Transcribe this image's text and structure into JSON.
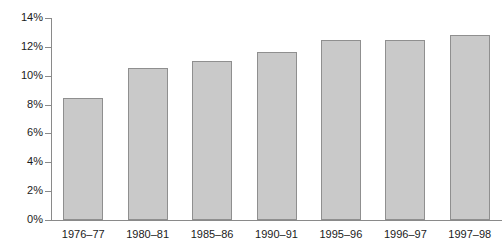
{
  "chart_data": {
    "type": "bar",
    "title": "",
    "subtitle": "",
    "xlabel": "",
    "ylabel": "",
    "categories": [
      "1976–77",
      "1980–81",
      "1985–86",
      "1990–91",
      "1995–96",
      "1996–97",
      "1997–98"
    ],
    "values": [
      8.45,
      10.55,
      11.05,
      11.65,
      12.5,
      12.45,
      12.85
    ],
    "value_unit": "%",
    "ylim": [
      0,
      14
    ],
    "ytick_values": [
      0,
      2,
      4,
      6,
      8,
      10,
      12,
      14
    ],
    "ytick_labels": [
      "0%",
      "2%",
      "4%",
      "6%",
      "8%",
      "10%",
      "12%",
      "14%"
    ],
    "grid": false,
    "legend": null,
    "legend_position": "none",
    "annotations": [],
    "colors": {
      "bar_fill": "#c9c9c9",
      "bar_border": "#8f8f8f",
      "axis": "#8a8a8a",
      "text": "#1a1a1a",
      "background": "#ffffff"
    }
  }
}
